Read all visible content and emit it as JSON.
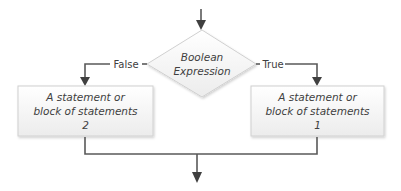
{
  "diagram": {
    "type": "flowchart",
    "colors": {
      "line": "#595959",
      "arrowhead": "#404040",
      "text": "#404040",
      "shape_fill_top": "#ffffff",
      "shape_fill_bottom": "#ececec",
      "shape_border": "#d0d0d0"
    },
    "decision": {
      "id": "boolean-expression",
      "shape": "diamond",
      "line1": "Boolean",
      "line2": "Expression"
    },
    "branches": {
      "false": {
        "label": "False",
        "target": "statement-2"
      },
      "true": {
        "label": "True",
        "target": "statement-1"
      }
    },
    "boxes": {
      "left": {
        "id": "statement-2",
        "line1": "A statement or",
        "line2": "block of statements",
        "line3": "2"
      },
      "right": {
        "id": "statement-1",
        "line1": "A statement or",
        "line2": "block of statements",
        "line3": "1"
      }
    },
    "nodes": [
      "entry-arrow",
      "boolean-expression",
      "statement-2",
      "statement-1",
      "merge-point",
      "exit-arrow"
    ],
    "edges": [
      {
        "from": "entry",
        "to": "boolean-expression",
        "label": ""
      },
      {
        "from": "boolean-expression",
        "to": "statement-2",
        "label": "False"
      },
      {
        "from": "boolean-expression",
        "to": "statement-1",
        "label": "True"
      },
      {
        "from": "statement-2",
        "to": "merge-point",
        "label": ""
      },
      {
        "from": "statement-1",
        "to": "merge-point",
        "label": ""
      },
      {
        "from": "merge-point",
        "to": "exit",
        "label": ""
      }
    ]
  }
}
